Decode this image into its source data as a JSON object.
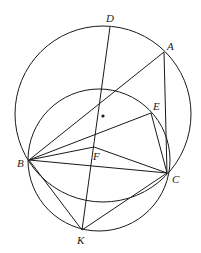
{
  "figure": {
    "width": 201,
    "height": 253,
    "stroke_color": "#1a1a1a",
    "background": "#ffffff"
  },
  "points": {
    "A": {
      "label": "A",
      "x": 164,
      "y": 52
    },
    "B": {
      "label": "B",
      "x": 29,
      "y": 160
    },
    "C": {
      "label": "C",
      "x": 167,
      "y": 173
    },
    "D": {
      "label": "D",
      "x": 110,
      "y": 27
    },
    "E": {
      "label": "E",
      "x": 151,
      "y": 113
    },
    "F": {
      "label": "F",
      "x": 94,
      "y": 147
    },
    "K": {
      "label": "K",
      "x": 82,
      "y": 230
    }
  },
  "center_dot": {
    "x": 103,
    "y": 116
  },
  "circles": [
    {
      "name": "outer-circle",
      "cx": 103,
      "cy": 114,
      "r": 88
    },
    {
      "name": "inner-circle",
      "cx": 99,
      "cy": 160,
      "r": 71
    }
  ],
  "segments": [
    [
      "D",
      "K"
    ],
    [
      "A",
      "B"
    ],
    [
      "A",
      "C"
    ],
    [
      "B",
      "E"
    ],
    [
      "E",
      "C"
    ],
    [
      "B",
      "F"
    ],
    [
      "F",
      "C"
    ],
    [
      "B",
      "C"
    ],
    [
      "B",
      "K"
    ],
    [
      "K",
      "C"
    ]
  ],
  "labels": {
    "A": "A",
    "B": "B",
    "C": "C",
    "D": "D",
    "E": "E",
    "F": "F",
    "K": "K"
  }
}
